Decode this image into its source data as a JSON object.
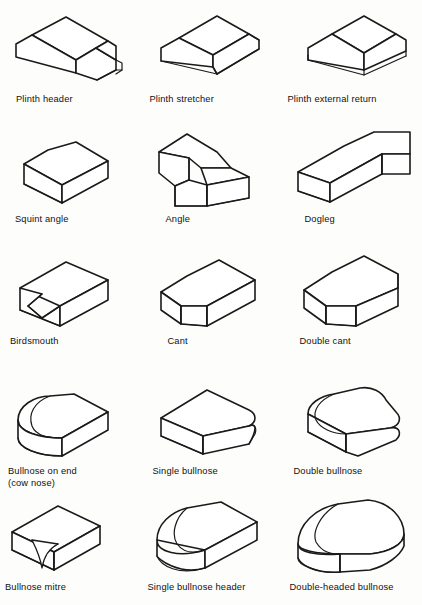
{
  "page": {
    "background_color": "#fdfdfb",
    "line_color": "#1a1a1a",
    "text_color": "#111111",
    "columns": 3,
    "rows": 5
  },
  "figures": [
    {
      "id": "plinth-header",
      "label": "Plinth header",
      "row": 1,
      "column": 1,
      "icon": "plinth-header-brick-icon"
    },
    {
      "id": "plinth-stretcher",
      "label": "Plinth stretcher",
      "row": 1,
      "column": 2,
      "icon": "plinth-stretcher-brick-icon"
    },
    {
      "id": "plinth-external-return",
      "label": "Plinth external return",
      "row": 1,
      "column": 3,
      "icon": "plinth-external-return-brick-icon"
    },
    {
      "id": "squint-angle",
      "label": "Squint angle",
      "row": 2,
      "column": 1,
      "icon": "squint-angle-brick-icon"
    },
    {
      "id": "angle",
      "label": "Angle",
      "row": 2,
      "column": 2,
      "icon": "angle-brick-icon"
    },
    {
      "id": "dogleg",
      "label": "Dogleg",
      "row": 2,
      "column": 3,
      "icon": "dogleg-brick-icon"
    },
    {
      "id": "birdsmouth",
      "label": "Birdsmouth",
      "row": 3,
      "column": 1,
      "icon": "birdsmouth-brick-icon"
    },
    {
      "id": "cant",
      "label": "Cant",
      "row": 3,
      "column": 2,
      "icon": "cant-brick-icon"
    },
    {
      "id": "double-cant",
      "label": "Double cant",
      "row": 3,
      "column": 3,
      "icon": "double-cant-brick-icon"
    },
    {
      "id": "bullnose-on-end",
      "label": "Bullnose on end\n(cow nose)",
      "row": 4,
      "column": 1,
      "icon": "bullnose-on-end-brick-icon"
    },
    {
      "id": "single-bullnose",
      "label": "Single bullnose",
      "row": 4,
      "column": 2,
      "icon": "single-bullnose-brick-icon"
    },
    {
      "id": "double-bullnose",
      "label": "Double bullnose",
      "row": 4,
      "column": 3,
      "icon": "double-bullnose-brick-icon"
    },
    {
      "id": "bullnose-mitre",
      "label": "Bullnose mitre",
      "row": 5,
      "column": 1,
      "icon": "bullnose-mitre-brick-icon"
    },
    {
      "id": "single-bullnose-header",
      "label": "Single bullnose header",
      "row": 5,
      "column": 2,
      "icon": "single-bullnose-header-brick-icon"
    },
    {
      "id": "double-headed-bullnose",
      "label": "Double-headed bullnose",
      "row": 5,
      "column": 3,
      "icon": "double-headed-bullnose-brick-icon"
    }
  ]
}
